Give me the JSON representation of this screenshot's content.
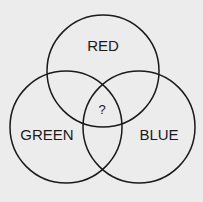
{
  "diagram": {
    "type": "venn",
    "circles": [
      {
        "id": "red",
        "label": "RED",
        "cx": 103,
        "cy": 71,
        "r": 56
      },
      {
        "id": "green",
        "label": "GREEN",
        "cx": 66,
        "cy": 127,
        "r": 56
      },
      {
        "id": "blue",
        "label": "BLUE",
        "cx": 139,
        "cy": 127,
        "r": 56
      }
    ],
    "center_label": "?",
    "colors": {
      "background": "#ececec",
      "stroke": "#1a1a1a"
    }
  }
}
